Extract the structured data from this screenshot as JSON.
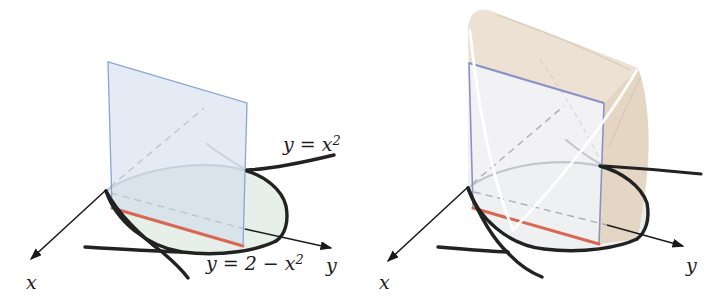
{
  "left_figure": {
    "labels": {
      "top_curve": {
        "text": "y = x",
        "exponent": "2"
      },
      "bottom_curve": {
        "text": "y = 2 − x",
        "exponent": "2"
      },
      "x_axis": "x",
      "y_axis": "y"
    }
  },
  "right_figure": {
    "labels": {
      "x_axis": "x",
      "y_axis": "y"
    }
  },
  "colors": {
    "background": "#ffffff",
    "cross_section_fill": "#cdd9ec",
    "cross_section_border": "#8ba3d6",
    "square_border_right": "#8b93c6",
    "base_region_fill": "#e7efe9",
    "chord_red": "#d96752",
    "curve_black": "#222222",
    "hidden_gray": "#9aa3ad",
    "axis_black": "#1a1a1a",
    "solid_front": "#f0f0f3",
    "solid_top": "#ebdfcf",
    "solid_side": "#e2d2bd",
    "white_edge": "#ffffff"
  }
}
